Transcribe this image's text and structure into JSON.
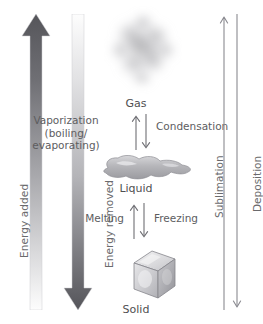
{
  "diagram": {
    "states": {
      "gas": "Gas",
      "liquid": "Liquid",
      "solid": "Solid"
    },
    "transitions": {
      "vaporization_line1": "Vaporization",
      "vaporization_line2": "(boiling/",
      "vaporization_line3": "evaporating)",
      "condensation": "Condensation",
      "melting": "Melting",
      "freezing": "Freezing",
      "sublimation": "Sublimation",
      "deposition": "Deposition"
    },
    "energy": {
      "added": "Energy added",
      "removed": "Energy removed"
    },
    "icons": {
      "gas_cloud": "gas-cloud-icon",
      "liquid_puddle": "liquid-puddle-icon",
      "ice_cube": "ice-cube-icon"
    },
    "colors": {
      "dark_gray": "#58585a",
      "mid_gray": "#8d8d8f",
      "light_gray": "#d9d9db",
      "text_gray": "#5d5d5f",
      "white": "#ffffff"
    }
  }
}
